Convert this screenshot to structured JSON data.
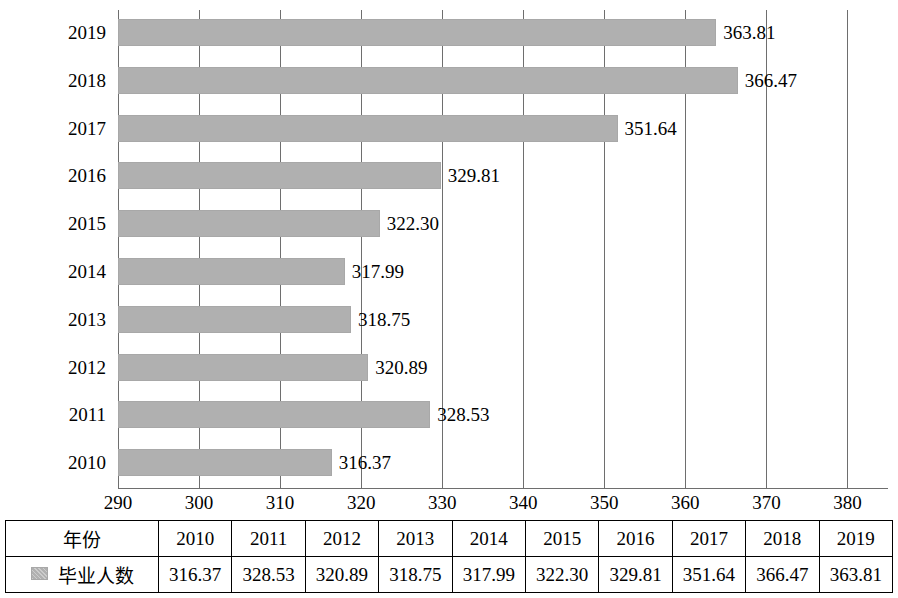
{
  "chart_data": {
    "type": "bar",
    "orientation": "horizontal",
    "title": "",
    "xlabel": "",
    "ylabel": "",
    "xlim": [
      290,
      385
    ],
    "xticks": [
      290,
      300,
      310,
      320,
      330,
      340,
      350,
      360,
      370,
      380
    ],
    "grid": true,
    "legend": "毕业人数",
    "categories": [
      "2010",
      "2011",
      "2012",
      "2013",
      "2014",
      "2015",
      "2016",
      "2017",
      "2018",
      "2019"
    ],
    "values": [
      316.37,
      328.53,
      320.89,
      318.75,
      317.99,
      322.3,
      329.81,
      351.64,
      366.47,
      363.81
    ],
    "bar_labels": [
      "316.37",
      "328.53",
      "320.89",
      "318.75",
      "317.99",
      "322.30",
      "329.81",
      "351.64",
      "366.47",
      "363.81"
    ],
    "bar_color": "#b0b0b0",
    "display_order": [
      "2019",
      "2018",
      "2017",
      "2016",
      "2015",
      "2014",
      "2013",
      "2012",
      "2011",
      "2010"
    ]
  },
  "table": {
    "header_label": "年份",
    "series_label": "毕业人数",
    "years": [
      "2010",
      "2011",
      "2012",
      "2013",
      "2014",
      "2015",
      "2016",
      "2017",
      "2018",
      "2019"
    ],
    "values": [
      "316.37",
      "328.53",
      "320.89",
      "318.75",
      "317.99",
      "322.30",
      "329.81",
      "351.64",
      "366.47",
      "363.81"
    ]
  }
}
